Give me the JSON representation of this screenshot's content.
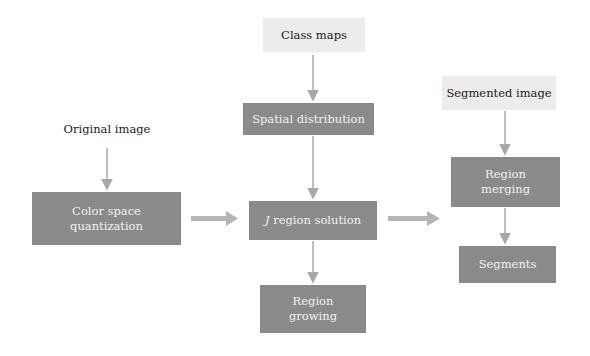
{
  "diagram": {
    "colors": {
      "process_box": "#8a8a8a",
      "io_box": "#ececec",
      "arrow": "#a8a8a8"
    },
    "nodes": {
      "class_maps": "Class maps",
      "original_image": "Original image",
      "segmented_image": "Segmented image",
      "spatial_distribution": "Spatial distribution",
      "color_space_quantization_1": "Color space",
      "color_space_quantization_2": "quantization",
      "j_region_italic": "J",
      "j_region_rest": " region solution",
      "region_growing_1": "Region",
      "region_growing_2": "growing",
      "region_merging_1": "Region",
      "region_merging_2": "merging",
      "segments": "Segments"
    },
    "edges": [
      [
        "Class maps",
        "Spatial distribution"
      ],
      [
        "Spatial distribution",
        "J region solution"
      ],
      [
        "Original image",
        "Color space quantization"
      ],
      [
        "Color space quantization",
        "J region solution"
      ],
      [
        "J region solution",
        "Region growing"
      ],
      [
        "J region solution",
        "Region merging"
      ],
      [
        "Segmented image",
        "Region merging"
      ],
      [
        "Region merging",
        "Segments"
      ]
    ]
  }
}
